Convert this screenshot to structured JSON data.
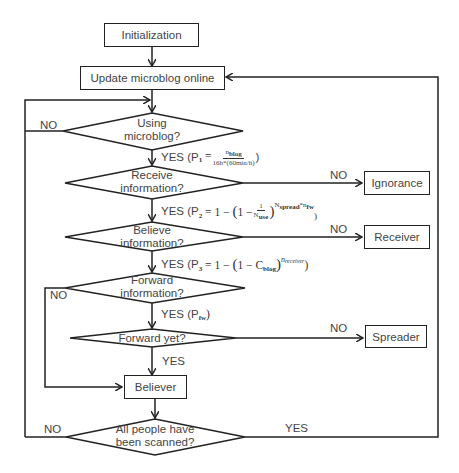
{
  "diagram": {
    "type": "flowchart",
    "nodes": {
      "init": "Initialization",
      "update": "Update microblog online",
      "using": [
        "Using",
        "microblog?"
      ],
      "receive": [
        "Receive",
        "information?"
      ],
      "believe": [
        "Believe",
        "information?"
      ],
      "forward_info": [
        "Forward",
        "information?"
      ],
      "forward_yet": "Forward yet?",
      "believer": "Believer",
      "scanned": [
        "All people have",
        "been scanned?"
      ],
      "ignorance": "Ignorance",
      "receiver": "Receiver",
      "spreader": "Spreader"
    },
    "labels": {
      "no": "NO",
      "yes": "YES",
      "yes_p1_prefix": "YES (P",
      "p1_sub": "1",
      "p1_eq": " = ",
      "p1_num": "n",
      "p1_num_sub": "blog",
      "p1_den": "16h*(60min/h)",
      "close": ")",
      "yes_p2_prefix": "YES (P",
      "p2_sub": "2",
      "p2_eq": " = 1 − ",
      "p2_inner": "1 − ",
      "p2_num": "1",
      "p2_den": "N",
      "p2_den_sub": "use",
      "p2_exp": "N",
      "p2_exp_sub": "spread",
      "p2_exp_rest": "*n",
      "p2_exp_sub2": "fw",
      "yes_p3_prefix": "YES (P",
      "p3_sub": "3",
      "p3_eq": " = 1 − ",
      "p3_inner": "1 − C",
      "p3_inner_sub": "blog",
      "p3_exp": "n",
      "p3_exp_sub": "receiver",
      "yes_pfw_prefix": "YES (P",
      "pfw_sub": "fw",
      "lparen": "(",
      "rparen": ")"
    },
    "edges": [
      {
        "from": "init",
        "to": "update"
      },
      {
        "from": "update",
        "to": "using"
      },
      {
        "from": "using",
        "to": "receive",
        "label": "YES (P1 = n_blog / (16h*(60min/h)))"
      },
      {
        "from": "using",
        "to": "using",
        "label": "NO",
        "note": "loop back via left line"
      },
      {
        "from": "receive",
        "to": "ignorance",
        "label": "NO"
      },
      {
        "from": "receive",
        "to": "believe",
        "label": "YES (P2 = 1 − (1 − 1/N_use)^(N_spread*n_fw))"
      },
      {
        "from": "believe",
        "to": "receiver",
        "label": "NO"
      },
      {
        "from": "believe",
        "to": "forward_info",
        "label": "YES (P3 = 1 − (1 − C_blog)^n_receiver)"
      },
      {
        "from": "forward_info",
        "to": "believer",
        "label": "NO"
      },
      {
        "from": "forward_info",
        "to": "forward_yet",
        "label": "YES (P_fw)"
      },
      {
        "from": "forward_yet",
        "to": "spreader",
        "label": "NO"
      },
      {
        "from": "forward_yet",
        "to": "believer",
        "label": "YES"
      },
      {
        "from": "believer",
        "to": "scanned"
      },
      {
        "from": "scanned",
        "to": "using",
        "label": "NO"
      },
      {
        "from": "scanned",
        "to": "update",
        "label": "YES"
      }
    ]
  }
}
